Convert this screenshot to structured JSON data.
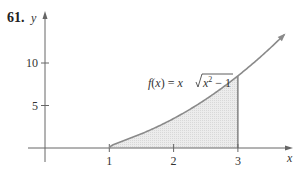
{
  "problem_number": "61.",
  "chart_data": {
    "type": "area",
    "title": "",
    "function_label": "f(x) = x√(x² − 1)",
    "function_label_parts": {
      "lhs": "f(x) = x",
      "radicand_base": "x",
      "radicand_exp": "2",
      "radicand_rest": " − 1"
    },
    "xlabel": "x",
    "ylabel": "y",
    "x_ticks": [
      1,
      2,
      3
    ],
    "y_ticks": [
      5,
      10
    ],
    "x_tick_labels": [
      "1",
      "2",
      "3"
    ],
    "y_tick_labels": [
      "5",
      "10"
    ],
    "shaded_region": {
      "from": 1,
      "to": 3,
      "color": "#e6e6e6"
    },
    "curve": {
      "x": [
        1,
        1.25,
        1.5,
        1.75,
        2,
        2.25,
        2.5,
        2.75,
        3,
        3.25,
        3.5,
        3.75
      ],
      "y": [
        0,
        0.94,
        1.68,
        2.51,
        3.46,
        4.53,
        5.73,
        7.04,
        8.49,
        10.05,
        11.74,
        13.55
      ]
    },
    "xlim": [
      -0.1,
      3.9
    ],
    "ylim": [
      -1,
      16
    ],
    "grid": false,
    "colors": {
      "curve": "#8a8a8a",
      "axis": "#555555",
      "fill": "#e6e6e6"
    }
  }
}
